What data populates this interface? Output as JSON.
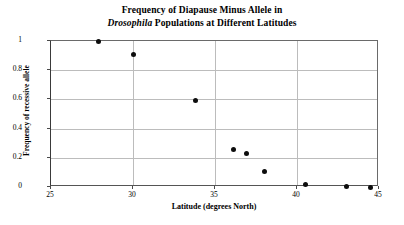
{
  "chart_data": {
    "type": "scatter",
    "title": "Frequency of Diapause Minus Allele in Drosophila Populations at Different Latitudes",
    "title_line1": "Frequency of Diapause Minus Allele in",
    "title_line2_italic": "Drosophila",
    "title_line2_rest": " Populations at Different Latitudes",
    "xlabel": "Latitude (degrees North)",
    "ylabel": "Frequency of recessive allele",
    "xlim": [
      25,
      45
    ],
    "ylim": [
      0,
      1
    ],
    "xticks": [
      25,
      30,
      35,
      40,
      45
    ],
    "yticks": [
      0,
      0.2,
      0.4,
      0.6,
      0.8,
      1
    ],
    "xtick_labels": [
      "25",
      "30",
      "35",
      "40",
      "45"
    ],
    "ytick_labels": [
      "0",
      "0.2",
      "0.4",
      "0.6",
      "0.8",
      "1"
    ],
    "grid": true,
    "legend": "none",
    "marker_color": "#0d0d0d",
    "grid_color": "#bcbcbc",
    "axis_color": "#555555",
    "points": [
      {
        "x": 27.9,
        "y": 1.0
      },
      {
        "x": 30.0,
        "y": 0.91
      },
      {
        "x": 33.8,
        "y": 0.59
      },
      {
        "x": 36.1,
        "y": 0.26
      },
      {
        "x": 36.9,
        "y": 0.23
      },
      {
        "x": 38.0,
        "y": 0.105
      },
      {
        "x": 40.5,
        "y": 0.015
      },
      {
        "x": 43.0,
        "y": 0.005
      },
      {
        "x": 44.5,
        "y": 0.0
      }
    ]
  }
}
